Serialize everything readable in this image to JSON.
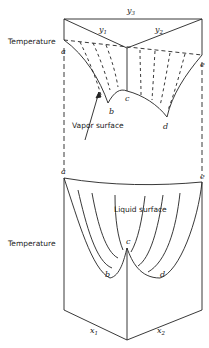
{
  "diagram": {
    "type": "3d-phase-diagram",
    "vapor": {
      "axis_label": "Temperature",
      "surface_label": "Vapor surface",
      "composition_labels": {
        "y3": "y",
        "y3_sub": "3",
        "y1": "y",
        "y1_sub": "1",
        "y2": "y",
        "y2_sub": "2"
      },
      "points": {
        "a": "a",
        "b": "b",
        "c": "c",
        "d": "d",
        "e": "e"
      }
    },
    "liquid": {
      "axis_label": "Temperature",
      "surface_label": "Liquid surface",
      "composition_labels": {
        "x1": "x",
        "x1_sub": "1",
        "x2": "x",
        "x2_sub": "2"
      },
      "points": {
        "a": "a",
        "b": "b",
        "c": "c",
        "d": "d",
        "e": "e"
      }
    }
  }
}
